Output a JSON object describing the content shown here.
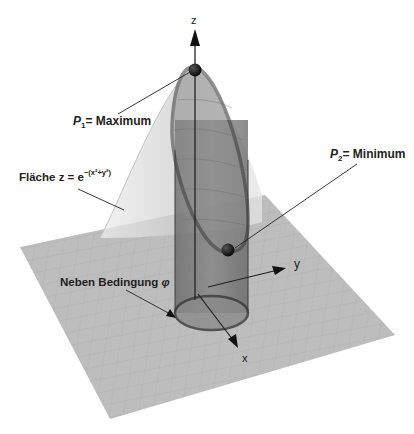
{
  "diagram": {
    "type": "3d-surface-with-constraint",
    "axes": {
      "x": "x",
      "y": "y",
      "z": "z"
    },
    "labels": {
      "surface_prefix": "Fläche z = e",
      "surface_exponent": "−(x²+y²)",
      "p1_name": "P",
      "p1_sub": "1",
      "p1_text": "= Maximum",
      "p2_name": "P",
      "p2_sub": "2",
      "p2_text": "= Minimum",
      "constraint_text": "Neben Bedingung ",
      "constraint_symbol": "φ"
    },
    "colors": {
      "plane": "#b8b8b8",
      "grid": "#a9a9a9",
      "surface": "#d6d6d6",
      "cylinder": "#6e6e6e",
      "ellipse_stroke": "#3a3a3a",
      "point": "#111111",
      "text": "#222222"
    }
  }
}
